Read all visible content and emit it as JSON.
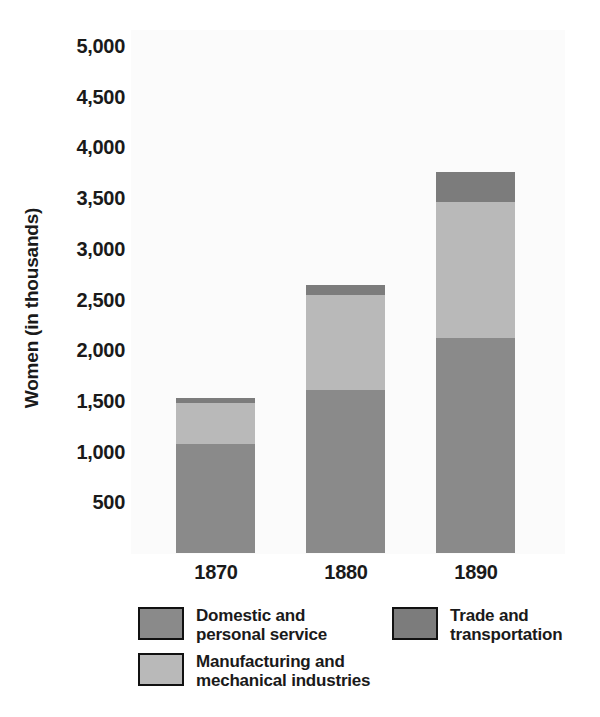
{
  "chart_data": {
    "type": "bar",
    "subtype": "stacked-bar",
    "title": "",
    "xlabel": "",
    "ylabel": "Women (in thousands)",
    "categories": [
      "1870",
      "1880",
      "1890"
    ],
    "ylim": [
      0,
      5000
    ],
    "yticks": [
      500,
      1000,
      1500,
      2000,
      2500,
      3000,
      3500,
      4000,
      4500,
      5000
    ],
    "ytick_labels": [
      "500",
      "1,000",
      "1,500",
      "2,000",
      "2,500",
      "3,000",
      "3,500",
      "4,000",
      "4,500",
      "5,000"
    ],
    "grid": false,
    "legend_position": "bottom",
    "series": [
      {
        "name": "Domestic and\npersonal service",
        "color": "#8a8a8a",
        "values": [
          1075,
          1608,
          2120
        ]
      },
      {
        "name": "Manufacturing and\nmechanical industries",
        "color": "#b9b9b9",
        "values": [
          405,
          937,
          1340
        ]
      },
      {
        "name": "Trade and\ntransportation",
        "color": "#7c7c7c",
        "values": [
          50,
          95,
          295
        ]
      }
    ],
    "totals": [
      1530,
      2640,
      3755
    ],
    "plot_background": "#fbfbfb",
    "text_color": "#1a1a1a"
  },
  "axis": {
    "y_title": "Women (in thousands)",
    "y_tick_labels": [
      "5,000",
      "4,500",
      "4,000",
      "3,500",
      "3,000",
      "2,500",
      "2,000",
      "1,500",
      "1,000",
      "500"
    ],
    "x_tick_labels": [
      "1870",
      "1880",
      "1890"
    ]
  },
  "legend": {
    "items": [
      {
        "label": "Domestic and\npersonal service",
        "color": "#8a8a8a",
        "swatch_border": "#111111"
      },
      {
        "label": "Trade and\ntransportation",
        "color": "#7c7c7c",
        "swatch_border": "#111111"
      },
      {
        "label": "Manufacturing and\nmechanical industries",
        "color": "#b9b9b9",
        "swatch_border": "#111111"
      }
    ]
  }
}
